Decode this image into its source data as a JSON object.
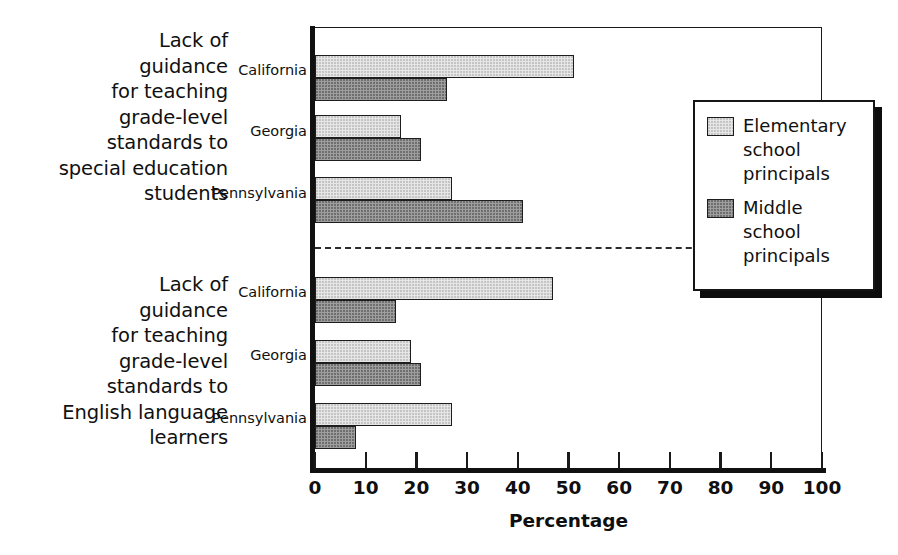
{
  "chart_data": {
    "type": "bar",
    "orientation": "horizontal",
    "title": "",
    "xlabel": "Percentage",
    "ylabel": "",
    "xlim": [
      0,
      100
    ],
    "xticks": [
      0,
      10,
      20,
      30,
      40,
      50,
      60,
      70,
      80,
      90,
      100
    ],
    "xtick_labels": [
      "0",
      "10",
      "20",
      "30",
      "40",
      "50",
      "60",
      "70",
      "80",
      "90",
      "100"
    ],
    "grid": false,
    "legend_position": "right",
    "legend_entries": [
      "Elementary\nschool\nprincipals",
      "Middle\nschool\nprincipals"
    ],
    "series": [
      {
        "name": "Elementary school principals",
        "fill": "#e6e6e6",
        "values": [
          51,
          17,
          27,
          47,
          19,
          27
        ]
      },
      {
        "name": "Middle school principals",
        "fill": "#9e9e9e",
        "values": [
          26,
          21,
          41,
          16,
          21,
          8
        ]
      }
    ],
    "categories": [
      "Lack of guidance for teaching grade-level standards to special education students - California",
      "Lack of guidance for teaching grade-level standards to special education students - Georgia",
      "Lack of guidance for teaching grade-level standards to special education students - Pennsylvania",
      "Lack of guidance for teaching grade-level standards to English language learners - California",
      "Lack of guidance for teaching grade-level standards to English language learners - Georgia",
      "Lack of guidance for teaching grade-level standards to English language learners - Pennsylvania"
    ],
    "groups": [
      {
        "label": "Lack of\nguidance\nfor teaching\ngrade-level\nstandards to\nspecial education\nstudents",
        "states": [
          "California",
          "Georgia",
          "Pennsylvania"
        ],
        "elementary": [
          51,
          17,
          27
        ],
        "middle": [
          26,
          21,
          41
        ]
      },
      {
        "label": "Lack of\nguidance\nfor teaching\ngrade-level\nstandards to\nEnglish language\nlearners",
        "states": [
          "California",
          "Georgia",
          "Pennsylvania"
        ],
        "elementary": [
          47,
          19,
          27
        ],
        "middle": [
          16,
          21,
          8
        ]
      }
    ]
  },
  "axis": {
    "x_title": "Percentage",
    "ticks": [
      {
        "label": "0"
      },
      {
        "label": "10"
      },
      {
        "label": "20"
      },
      {
        "label": "30"
      },
      {
        "label": "40"
      },
      {
        "label": "50"
      },
      {
        "label": "60"
      },
      {
        "label": "70"
      },
      {
        "label": "80"
      },
      {
        "label": "90"
      },
      {
        "label": "100"
      }
    ]
  },
  "groups": [
    {
      "label": "Lack of\nguidance\nfor teaching\ngrade-level\nstandards to\nspecial education\nstudents",
      "states": [
        "California",
        "Georgia",
        "Pennsylvania"
      ]
    },
    {
      "label": "Lack of\nguidance\nfor teaching\ngrade-level\nstandards to\nEnglish language\nlearners",
      "states": [
        "California",
        "Georgia",
        "Pennsylvania"
      ]
    }
  ],
  "legend": {
    "entries": [
      {
        "label": "Elementary\nschool\nprincipals",
        "key": "elementary"
      },
      {
        "label": "Middle\nschool\nprincipals",
        "key": "middle"
      }
    ]
  }
}
